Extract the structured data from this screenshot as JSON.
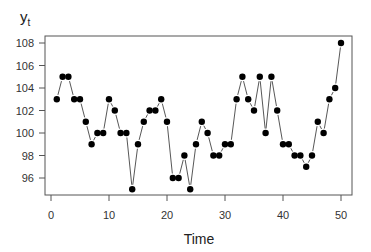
{
  "chart_data": {
    "type": "line",
    "title": "",
    "xlabel": "Time",
    "ylabel": "y_t",
    "ylabel_main": "y",
    "ylabel_sub": "t",
    "xlim": [
      -1,
      52
    ],
    "ylim": [
      94.5,
      108.6
    ],
    "xticks": [
      0,
      10,
      20,
      30,
      40,
      50
    ],
    "yticks": [
      96,
      98,
      100,
      102,
      104,
      106,
      108
    ],
    "grid": false,
    "legend": null,
    "markers": "filled-circle",
    "x": [
      1,
      2,
      3,
      4,
      5,
      6,
      7,
      8,
      9,
      10,
      11,
      12,
      13,
      14,
      15,
      16,
      17,
      18,
      19,
      20,
      21,
      22,
      23,
      24,
      25,
      26,
      27,
      28,
      29,
      30,
      31,
      32,
      33,
      34,
      35,
      36,
      37,
      38,
      39,
      40,
      41,
      42,
      43,
      44,
      45,
      46,
      47,
      48,
      49,
      50
    ],
    "series": [
      {
        "name": "y_t",
        "values": [
          103,
          105,
          105,
          103,
          103,
          101,
          99,
          100,
          100,
          103,
          102,
          100,
          100,
          95,
          99,
          101,
          102,
          102,
          103,
          101,
          96,
          96,
          98,
          95,
          99,
          101,
          100,
          98,
          98,
          99,
          99,
          103,
          105,
          103,
          102,
          105,
          100,
          105,
          102,
          99,
          99,
          98,
          98,
          97,
          98,
          101,
          100,
          103,
          104,
          108
        ]
      }
    ]
  }
}
